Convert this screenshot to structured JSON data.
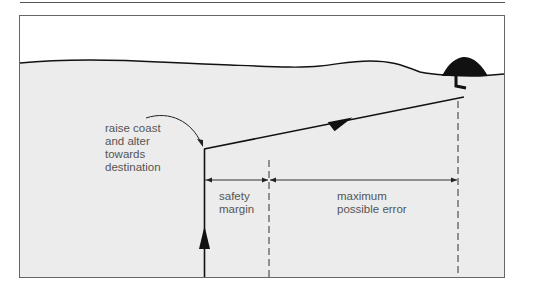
{
  "diagram": {
    "title": "",
    "labels": {
      "raise_coast": "raise coast\nand alter\ntowards\ndestination",
      "safety_margin": "safety\nmargin",
      "maximum_possible_error": "maximum\npossible error"
    },
    "elements": {
      "land_fill_color": "#eeeeee",
      "sky_color": "#ffffff",
      "line_color": "#111111",
      "text_color": "#555555"
    }
  }
}
